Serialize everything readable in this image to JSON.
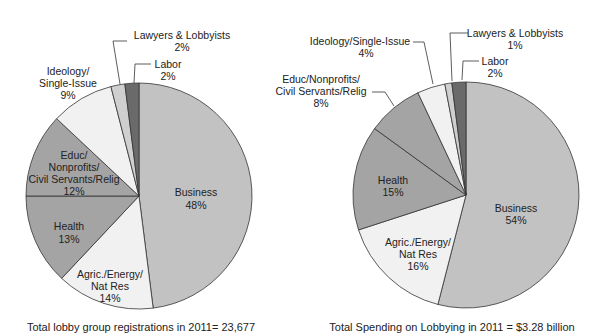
{
  "chart_data": [
    {
      "type": "pie",
      "title": "",
      "caption": "Total lobby group registrations in 2011= 23,677",
      "slices": [
        {
          "label": "Business",
          "value": 48,
          "text": "48%",
          "color": "#c2c2c2"
        },
        {
          "label": "Agric./Energy/ Nat Res",
          "value": 14,
          "text": "14%",
          "color": "#f1f1f1"
        },
        {
          "label": "Health",
          "value": 13,
          "text": "13%",
          "color": "#a4a4a4"
        },
        {
          "label": "Educ/ Nonprofits/ Civil Servants/Relig",
          "value": 12,
          "text": "12%",
          "color": "#a4a4a4"
        },
        {
          "label": "Ideology/ Single-Issue",
          "value": 9,
          "text": "9%",
          "color": "#f1f1f1"
        },
        {
          "label": "Lawyers & Lobbyists",
          "value": 2,
          "text": "2%",
          "color": "#cfcfcf"
        },
        {
          "label": "Labor",
          "value": 2,
          "text": "2%",
          "color": "#6a6a6a"
        }
      ]
    },
    {
      "type": "pie",
      "title": "",
      "caption": "Total Spending on Lobbying in 2011 =  $3.28 billion",
      "slices": [
        {
          "label": "Business",
          "value": 54,
          "text": "54%",
          "color": "#c2c2c2"
        },
        {
          "label": "Agric./Energy/ Nat Res",
          "value": 16,
          "text": "16%",
          "color": "#f1f1f1"
        },
        {
          "label": "Health",
          "value": 15,
          "text": "15%",
          "color": "#a4a4a4"
        },
        {
          "label": "Educ/Nonprofits/ Civil Servants/Relig",
          "value": 8,
          "text": "8%",
          "color": "#a4a4a4"
        },
        {
          "label": "Ideology/Single-Issue",
          "value": 4,
          "text": "4%",
          "color": "#f1f1f1"
        },
        {
          "label": "Lawyers & Lobbyists",
          "value": 1,
          "text": "1%",
          "color": "#cfcfcf"
        },
        {
          "label": "Labor",
          "value": 2,
          "text": "2%",
          "color": "#6a6a6a"
        }
      ]
    }
  ],
  "left": {
    "caption": "Total lobby group registrations in 2011= 23,677",
    "labels": {
      "business": [
        "Business",
        "48%"
      ],
      "agric": [
        "Agric./Energy/",
        "Nat Res",
        "14%"
      ],
      "health": [
        "Health",
        "13%"
      ],
      "educ": [
        "Educ/",
        "Nonprofits/",
        "Civil Servants/Relig",
        "12%"
      ],
      "ideology": [
        "Ideology/",
        "Single-Issue",
        "9%"
      ],
      "lawyers": [
        "Lawyers & Lobbyists",
        "2%"
      ],
      "labor": [
        "Labor",
        "2%"
      ]
    }
  },
  "right": {
    "caption": "Total Spending on Lobbying in 2011 =  $3.28 billion",
    "labels": {
      "business": [
        "Business",
        "54%"
      ],
      "agric": [
        "Agric./Energy/",
        "Nat Res",
        "16%"
      ],
      "health": [
        "Health",
        "15%"
      ],
      "educ": [
        "Educ/Nonprofits/",
        "Civil Servants/Relig",
        "8%"
      ],
      "ideology": [
        "Ideology/Single-Issue",
        "4%"
      ],
      "lawyers": [
        "Lawyers & Lobbyists",
        "1%"
      ],
      "labor": [
        "Labor",
        "2%"
      ]
    }
  }
}
